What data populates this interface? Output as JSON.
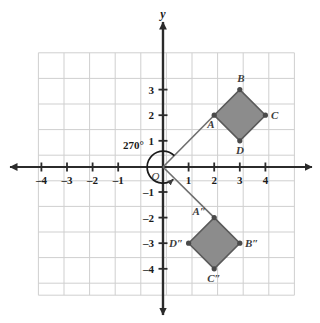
{
  "figure": {
    "type": "coordinate-plane-rotation-diagram",
    "axes": {
      "x_name": "",
      "y_name": "y",
      "x_ticks": [
        -4,
        -3,
        -2,
        -1,
        1,
        2,
        3,
        4
      ],
      "y_ticks": [
        3,
        2,
        1,
        -1,
        -2,
        -3,
        -4
      ],
      "x_tick_labels": [
        "–4",
        "–3",
        "–2",
        "–1",
        "1",
        "2",
        "3",
        "4"
      ],
      "y_tick_labels": [
        "3",
        "2",
        "1",
        "–1",
        "–2",
        "–3",
        "–4"
      ],
      "origin_label": "O",
      "xlim": [
        -5,
        5
      ],
      "ylim": [
        -5,
        5
      ],
      "grid": true
    },
    "angle": {
      "label": "270°",
      "direction": "clockwise",
      "center": "O"
    },
    "shapes": [
      {
        "name": "preimage",
        "label_set": [
          "A",
          "B",
          "C",
          "D"
        ],
        "vertices": [
          {
            "label": "A",
            "x": 2,
            "y": 2,
            "label_pos": "below-left"
          },
          {
            "label": "B",
            "x": 3,
            "y": 3,
            "label_pos": "above"
          },
          {
            "label": "C",
            "x": 4,
            "y": 2,
            "label_pos": "right"
          },
          {
            "label": "D",
            "x": 3,
            "y": 1,
            "label_pos": "below"
          }
        ],
        "fill": "#8c8c8c",
        "stroke": "#5a5a5a"
      },
      {
        "name": "image",
        "label_set": [
          "A″",
          "B″",
          "C″",
          "D″"
        ],
        "vertices": [
          {
            "label": "A″",
            "x": 2,
            "y": -2,
            "label_pos": "above-left"
          },
          {
            "label": "B″",
            "x": 3,
            "y": -3,
            "label_pos": "right"
          },
          {
            "label": "C″",
            "x": 2,
            "y": -4,
            "label_pos": "below"
          },
          {
            "label": "D″",
            "x": 1,
            "y": -3,
            "label_pos": "left"
          }
        ],
        "fill": "#8c8c8c",
        "stroke": "#5a5a5a"
      }
    ],
    "rays": [
      {
        "name": "ray-to-A",
        "from": [
          0,
          0
        ],
        "to": [
          2,
          2
        ]
      },
      {
        "name": "ray-to-A-image",
        "from": [
          0,
          0
        ],
        "to": [
          2,
          -2
        ]
      }
    ],
    "colors": {
      "grid": "#cfcfcf",
      "axis": "#2b2b2b",
      "shape_fill": "#8c8c8c",
      "shape_stroke": "#5a5a5a",
      "ray": "#6e6e6e",
      "text": "#1a1a1a"
    }
  }
}
